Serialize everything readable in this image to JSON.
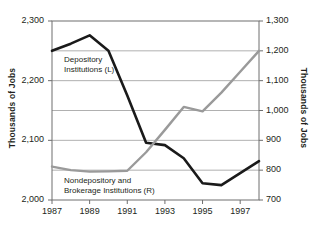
{
  "chart_data": {
    "type": "line",
    "title": "",
    "subtitle": "",
    "xlabel": "",
    "ylabel": "Thousands of Jobs",
    "ylabel_right": "Thousands of Jobs",
    "x": [
      1987,
      1988,
      1989,
      1990,
      1991,
      1992,
      1993,
      1994,
      1995,
      1996,
      1997,
      1998
    ],
    "xlim": [
      1987,
      1998
    ],
    "xtick_labels": [
      "1987",
      "1989",
      "1991",
      "1993",
      "1995",
      "1997"
    ],
    "xtick_values": [
      1987,
      1989,
      1991,
      1993,
      1995,
      1997
    ],
    "grid": true,
    "grid_axis": "y",
    "legend": "inline-annotations",
    "axes": [
      {
        "id": "left",
        "label": "Thousands of Jobs",
        "ylim": [
          2000,
          2300
        ],
        "ytick_labels": [
          "2,000",
          "2,100",
          "2,200",
          "2,300"
        ],
        "ytick_values": [
          2000,
          2100,
          2200,
          2300
        ],
        "gridline_values": [
          2050,
          2150,
          2250
        ]
      },
      {
        "id": "right",
        "label": "Thousands of Jobs",
        "ylim": [
          700,
          1300
        ],
        "ytick_labels": [
          "700",
          "800",
          "900",
          "1,000",
          "1,100",
          "1,200",
          "1,300"
        ],
        "ytick_values": [
          700,
          800,
          900,
          1000,
          1100,
          1200,
          1300
        ],
        "gridline_values": [
          800,
          900,
          1000,
          1100,
          1200
        ]
      }
    ],
    "series": [
      {
        "name": "Depository Institutions (L)",
        "axis": "left",
        "color": "#1a1a1a",
        "label_text": [
          "Depository",
          "Institutions (L)"
        ],
        "values": [
          2250,
          2262,
          2276,
          2250,
          2175,
          2096,
          2092,
          2070,
          2028,
          2025,
          2045,
          2065
        ]
      },
      {
        "name": "Nondepository and Brokerage Institutions (R)",
        "axis": "right",
        "color": "#9a9a9a",
        "label_text": [
          "Nondepository and",
          "Brokerage Institutions (R)"
        ],
        "values": [
          812,
          800,
          795,
          796,
          798,
          860,
          935,
          1012,
          997,
          1060,
          1130,
          1200
        ]
      }
    ]
  }
}
